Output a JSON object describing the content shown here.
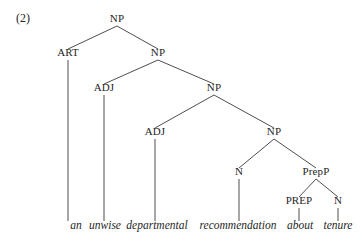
{
  "figure": {
    "example_number": "(2)",
    "caption_text": "an unwise departmental recommendation about tenure",
    "ink_color": "#3a3a3a",
    "text_color": "#262626",
    "background_color": "#ffffff"
  },
  "tree": {
    "type": "constituency-parse-tree",
    "nodes": [
      {
        "id": "np-root",
        "label": "NP",
        "x": 117,
        "y": 22,
        "level": 0
      },
      {
        "id": "art-1",
        "label": "ART",
        "x": 68,
        "y": 56,
        "level": 1
      },
      {
        "id": "np-2",
        "label": "NP",
        "x": 158,
        "y": 56,
        "level": 1
      },
      {
        "id": "adj-1",
        "label": "ADJ",
        "x": 104,
        "y": 91,
        "level": 2
      },
      {
        "id": "np-3",
        "label": "NP",
        "x": 214,
        "y": 91,
        "level": 2
      },
      {
        "id": "adj-2",
        "label": "ADJ",
        "x": 155,
        "y": 135,
        "level": 3
      },
      {
        "id": "np-4",
        "label": "NP",
        "x": 274,
        "y": 135,
        "level": 3
      },
      {
        "id": "n-1",
        "label": "N",
        "x": 239,
        "y": 175,
        "level": 4
      },
      {
        "id": "prepp-1",
        "label": "PrepP",
        "x": 316,
        "y": 175,
        "level": 4
      },
      {
        "id": "prep-1",
        "label": "PREP",
        "x": 299,
        "y": 204,
        "level": 5
      },
      {
        "id": "n-2",
        "label": "N",
        "x": 338,
        "y": 204,
        "level": 5
      }
    ],
    "edges": [
      {
        "from": "np-root",
        "to": "art-1"
      },
      {
        "from": "np-root",
        "to": "np-2"
      },
      {
        "from": "np-2",
        "to": "adj-1"
      },
      {
        "from": "np-2",
        "to": "np-3"
      },
      {
        "from": "np-3",
        "to": "adj-2"
      },
      {
        "from": "np-3",
        "to": "np-4"
      },
      {
        "from": "np-4",
        "to": "n-1"
      },
      {
        "from": "np-4",
        "to": "prepp-1"
      },
      {
        "from": "prepp-1",
        "to": "prep-1"
      },
      {
        "from": "prepp-1",
        "to": "n-2"
      }
    ],
    "terminals": [
      {
        "id": "word-an",
        "word": "an",
        "parent": "art-1",
        "x": 76,
        "y": 229
      },
      {
        "id": "word-unwise",
        "word": "unwise",
        "parent": "adj-1",
        "x": 105,
        "y": 229
      },
      {
        "id": "word-departmental",
        "word": "departmental",
        "parent": "adj-2",
        "x": 157,
        "y": 229
      },
      {
        "id": "word-recommendation",
        "word": "recommendation",
        "parent": "n-1",
        "x": 238,
        "y": 229
      },
      {
        "id": "word-about",
        "word": "about",
        "parent": "prep-1",
        "x": 300,
        "y": 229
      },
      {
        "id": "word-tenure",
        "word": "tenure",
        "parent": "n-2",
        "x": 338,
        "y": 229
      }
    ]
  },
  "layout": {
    "label_half_height": 4,
    "label_gap_below": 4,
    "terminal_stem_gap": 8,
    "example_number_x": 16,
    "example_number_y": 22
  }
}
